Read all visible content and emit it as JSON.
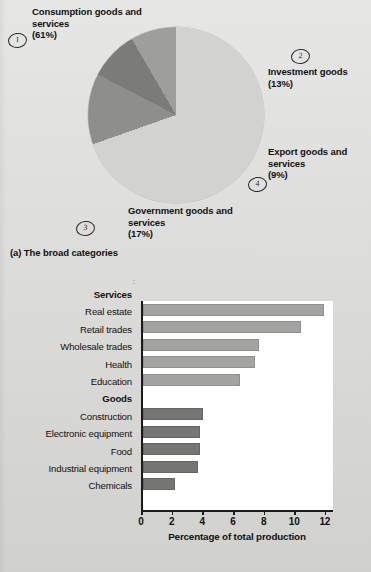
{
  "figure": {
    "panel_a_caption": "(a) The broad categories",
    "panel_b_caption": "(b) Some of the details"
  },
  "colors": {
    "page_background": "#d9d9d6",
    "pie_consumption": "#d2d2d0",
    "pie_investment": "#8e8e8c",
    "pie_export": "#7b7b79",
    "pie_government": "#9e9e9c",
    "bar_services": "#a3a3a1",
    "bar_goods": "#757573",
    "axis": "#1a1a1a",
    "plot_background": "#ffffff"
  },
  "markers": [
    {
      "name": "marker-1",
      "label": "1"
    },
    {
      "name": "marker-2",
      "label": "2"
    },
    {
      "name": "marker-3",
      "label": "3"
    },
    {
      "name": "marker-4",
      "label": "4"
    }
  ],
  "pie_callouts": {
    "consumption": "Consumption goods and services (61%)",
    "investment": "Investment goods (13%)",
    "export": "Export goods and services (9%)",
    "government": "Government goods and services (17%)"
  },
  "chart_data": [
    {
      "type": "pie",
      "title": "(a) The broad categories",
      "labels": [
        "Consumption goods and services",
        "Investment goods",
        "Export goods and services",
        "Government goods and services"
      ],
      "values": [
        61,
        13,
        9,
        17
      ],
      "value_unit": "%",
      "colors": [
        "#d2d2d0",
        "#8e8e8c",
        "#7b7b79",
        "#9e9e9c"
      ],
      "legend": "callouts",
      "start_angle_deg": 31,
      "direction": "clockwise"
    },
    {
      "type": "bar",
      "orientation": "horizontal",
      "title": "(b) Some of the details",
      "xlabel": "Percentage of total production",
      "ylabel": "",
      "xlim": [
        0,
        12.4
      ],
      "xticks": [
        0,
        2,
        4,
        6,
        8,
        10,
        12
      ],
      "xtick_labels": [
        "0",
        "2",
        "4",
        "6",
        "8",
        "10",
        "12"
      ],
      "grid": false,
      "groups": [
        {
          "name": "Services",
          "color": "#a3a3a1",
          "categories": [
            "Real estate",
            "Retail trades",
            "Wholesale trades",
            "Health",
            "Education"
          ],
          "values": [
            11.8,
            10.3,
            7.6,
            7.3,
            6.3
          ]
        },
        {
          "name": "Goods",
          "color": "#757573",
          "categories": [
            "Construction",
            "Electronic equipment",
            "Food",
            "Industrial equipment",
            "Chemicals"
          ],
          "values": [
            3.9,
            3.7,
            3.7,
            3.6,
            2.1
          ]
        }
      ]
    }
  ]
}
